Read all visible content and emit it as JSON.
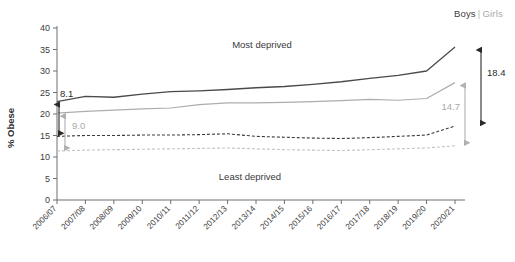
{
  "legend": {
    "boys_label": "Boys",
    "separator": "|",
    "girls_label": "Girls",
    "boys_color": "#404040",
    "girls_color": "#a8a8a8"
  },
  "annotations": {
    "left_gap_boys": "8.1",
    "left_gap_girls": "9.0",
    "right_gap_boys": "18.4",
    "right_gap_girls": "14.7",
    "band_top": "Most deprived",
    "band_bottom": "Least deprived"
  },
  "chart_data": {
    "type": "line",
    "title": "",
    "xlabel": "",
    "ylabel": "% Obese",
    "ylim": [
      0,
      40
    ],
    "yticks": [
      0,
      5,
      10,
      15,
      20,
      25,
      30,
      35,
      40
    ],
    "grid": false,
    "legend_position": "top-right",
    "categories": [
      "2006/07",
      "2007/08",
      "2008/09",
      "2009/10",
      "2010/11",
      "2011/12",
      "2012/13",
      "2013/14",
      "2014/15",
      "2015/16",
      "2016/17",
      "2017/18",
      "2018/19",
      "2019/20",
      "2020/21"
    ],
    "series": [
      {
        "name": "Boys - Most deprived",
        "style": "solid",
        "color": "#4a4a4a",
        "values": [
          22.9,
          24.1,
          23.9,
          24.6,
          25.2,
          25.4,
          25.7,
          26.1,
          26.4,
          26.9,
          27.5,
          28.3,
          29.0,
          30.0,
          35.6
        ]
      },
      {
        "name": "Girls - Most deprived",
        "style": "solid",
        "color": "#adadad",
        "values": [
          20.2,
          20.6,
          20.9,
          21.2,
          21.4,
          22.2,
          22.6,
          22.6,
          22.7,
          22.9,
          23.1,
          23.4,
          23.2,
          23.6,
          27.3
        ]
      },
      {
        "name": "Boys - Least deprived",
        "style": "dashed",
        "color": "#3a3a3a",
        "values": [
          14.8,
          15.0,
          15.0,
          15.1,
          15.1,
          15.2,
          15.4,
          14.8,
          14.6,
          14.4,
          14.3,
          14.5,
          14.8,
          15.1,
          17.2
        ]
      },
      {
        "name": "Girls - Least deprived",
        "style": "dashed",
        "color": "#c2c2c2",
        "values": [
          11.4,
          11.6,
          11.7,
          11.8,
          11.9,
          12.0,
          12.1,
          11.9,
          11.7,
          11.6,
          11.5,
          11.7,
          11.9,
          12.1,
          12.6
        ]
      }
    ],
    "gap_annotations": [
      {
        "name": "boys-gap-start",
        "label": "8.1",
        "year": "2006/07",
        "from": 22.9,
        "to": 14.8
      },
      {
        "name": "girls-gap-start",
        "label": "9.0",
        "year": "2006/07",
        "from": 20.2,
        "to": 11.4
      },
      {
        "name": "boys-gap-end",
        "label": "18.4",
        "year": "2020/21",
        "from": 35.6,
        "to": 17.2
      },
      {
        "name": "girls-gap-end",
        "label": "14.7",
        "year": "2020/21",
        "from": 27.3,
        "to": 12.6
      }
    ]
  }
}
